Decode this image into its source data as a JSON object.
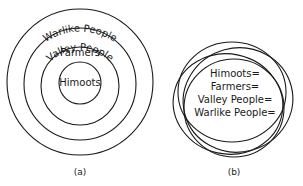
{
  "diagram_a": {
    "caption": "(a)",
    "rings": [
      {
        "label": "Warlike People"
      },
      {
        "label": "Valley People"
      },
      {
        "label": "Farmers"
      },
      {
        "label": "Himoots"
      }
    ]
  },
  "diagram_b": {
    "caption": "(b)",
    "lines": [
      "Himoots=",
      "Farmers=",
      "Valley People=",
      "Warlike People="
    ]
  },
  "colors": {
    "stroke": "#1a1a1a",
    "background": "#ffffff"
  }
}
